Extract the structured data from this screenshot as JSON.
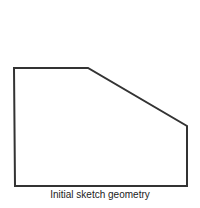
{
  "figure": {
    "caption": "Initial sketch geometry",
    "shape": {
      "type": "polygon",
      "points": [
        [
          14,
          68
        ],
        [
          88,
          68
        ],
        [
          187,
          126
        ],
        [
          187,
          186
        ],
        [
          15,
          186
        ]
      ],
      "stroke": "#333333"
    }
  }
}
